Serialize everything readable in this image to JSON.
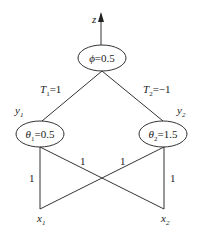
{
  "diagram": {
    "output": {
      "label": "z"
    },
    "output_node": {
      "symbol": "ϕ",
      "value": "=0.5"
    },
    "hidden_nodes": [
      {
        "var": "y",
        "sub": "1",
        "symbol": "θ",
        "symbol_sub": "1",
        "value": "=0.5"
      },
      {
        "var": "y",
        "sub": "2",
        "symbol": "θ",
        "symbol_sub": "2",
        "value": "=1.5"
      }
    ],
    "top_weights": [
      {
        "var": "T",
        "sub": "1",
        "value": "=1"
      },
      {
        "var": "T",
        "sub": "2",
        "value": "=−1"
      }
    ],
    "bottom_weights": {
      "x1_y1": "1",
      "x1_y2": "1",
      "x2_y1": "1",
      "x2_y2": "1"
    },
    "inputs": [
      {
        "var": "x",
        "sub": "1"
      },
      {
        "var": "x",
        "sub": "2"
      }
    ]
  }
}
